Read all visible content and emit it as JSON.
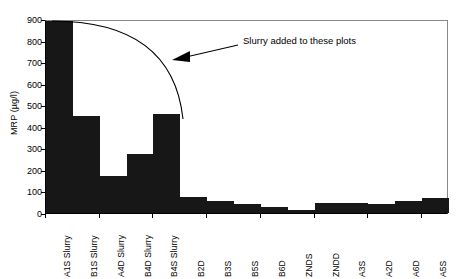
{
  "chart_data": {
    "type": "bar",
    "title": "",
    "xlabel": "",
    "ylabel": "MRP (µg/l)",
    "ylim": [
      0,
      900
    ],
    "ytick_values": [
      0,
      100,
      200,
      300,
      400,
      500,
      600,
      700,
      800,
      900
    ],
    "ytick_labels": [
      "0",
      "100",
      "200",
      "300",
      "400",
      "500",
      "600",
      "700",
      "800",
      "900"
    ],
    "grid": false,
    "legend": null,
    "bar_color": "#171717",
    "categories": [
      "A1S Slurry",
      "B1S Slurry",
      "A4D Slurry",
      "B4D Slurry",
      "B4S Slurry",
      "B2D",
      "B3S",
      "B5S",
      "B6D",
      "ZNDS",
      "ZNDD",
      "A3S",
      "A2D",
      "A6D",
      "A5S"
    ],
    "values": [
      890,
      450,
      170,
      275,
      460,
      75,
      55,
      42,
      30,
      14,
      45,
      45,
      40,
      58,
      68
    ],
    "annotations": [
      {
        "text": "Slurry added to these plots",
        "type": "arrow-callout",
        "points_to": "curve spanning the five slurry-treated plots"
      }
    ]
  },
  "axis": {
    "y_title": "MRP (µg/l)"
  }
}
